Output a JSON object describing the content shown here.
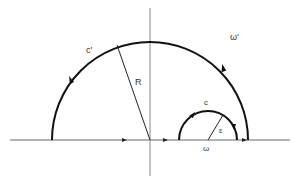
{
  "diagram": {
    "type": "contour-integration",
    "labels": {
      "outer_contour": "c'",
      "outer_radius": "R",
      "outer_point": "ω'",
      "inner_contour": "c",
      "inner_radius": "ε",
      "inner_point": "ω"
    },
    "geometry": {
      "axis_y": 140,
      "axis_x": 150,
      "outer_center": [
        150,
        140
      ],
      "outer_radius": 98,
      "inner_center": [
        208,
        140
      ],
      "inner_radius": 29
    },
    "colors": {
      "curve": "#111111",
      "axis": "#555555",
      "label": "#333333"
    }
  }
}
